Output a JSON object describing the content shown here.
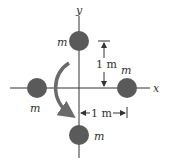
{
  "diagram": {
    "axes": {
      "x_label": "x",
      "y_label": "y"
    },
    "masses": [
      {
        "id": "top",
        "label": "m"
      },
      {
        "id": "left",
        "label": "m"
      },
      {
        "id": "right",
        "label": "m"
      },
      {
        "id": "bottom",
        "label": "m"
      }
    ],
    "dimensions": {
      "vertical": "1 m",
      "horizontal": "1 m"
    },
    "rotation": "clockwise",
    "colors": {
      "mass_fill": "#5a5a5a",
      "line": "#333333",
      "arrow": "#6a6a6a"
    }
  }
}
